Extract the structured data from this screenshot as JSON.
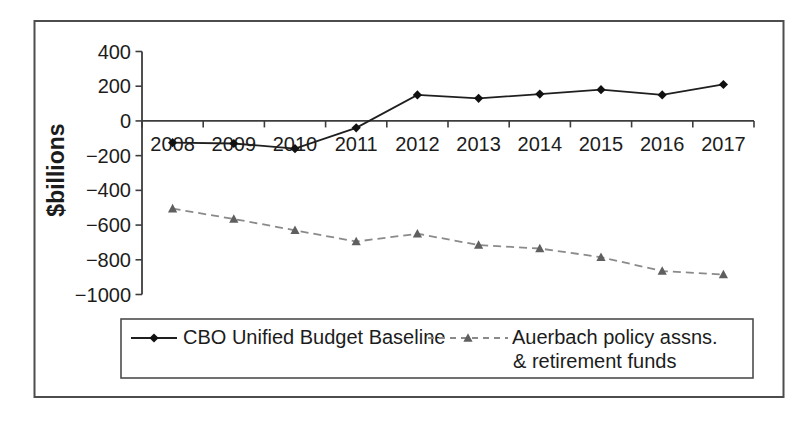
{
  "figure": {
    "background": "#ffffff",
    "frame_color": "#4d4d4d"
  },
  "chart_data": {
    "type": "line",
    "title": "",
    "xlabel": "",
    "ylabel": "$billions",
    "categories": [
      "2008",
      "2009",
      "2010",
      "2011",
      "2012",
      "2013",
      "2014",
      "2015",
      "2016",
      "2017"
    ],
    "series": [
      {
        "name": "CBO Unified Budget Baseline",
        "values": [
          -125,
          -130,
          -160,
          -40,
          150,
          130,
          155,
          180,
          150,
          210
        ],
        "color": "#1f1f1f",
        "marker": "diamond",
        "marker_color": "#111111",
        "line_style": "solid"
      },
      {
        "name": "Auerbach policy assns. & retirement funds",
        "values": [
          -505,
          -565,
          -630,
          -695,
          -650,
          -715,
          -735,
          -785,
          -865,
          -885
        ],
        "color": "#8a8a8a",
        "marker": "triangle",
        "marker_color": "#5f5f5f",
        "line_style": "dashed"
      }
    ],
    "ylim": [
      -1000,
      400
    ],
    "yticks": [
      400,
      200,
      0,
      -200,
      -400,
      -600,
      -800,
      -1000
    ],
    "x_labels_position": "next-to-zero-axis",
    "grid": false,
    "legend_position": "bottom",
    "axis_color": "#3d3d3d"
  },
  "legend": {
    "boxed": true,
    "items": [
      {
        "label": "CBO Unified Budget Baseline",
        "marker": "diamond",
        "line_style": "solid"
      },
      {
        "label": "Auerbach policy assns.",
        "label_line2": "& retirement funds",
        "marker": "triangle",
        "line_style": "dashed"
      }
    ]
  }
}
